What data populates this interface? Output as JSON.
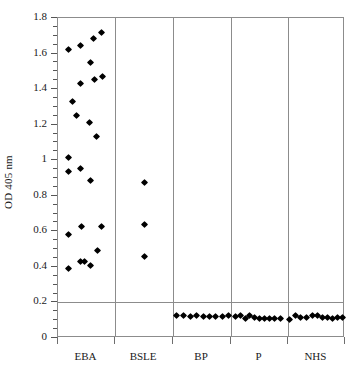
{
  "chart_data": {
    "type": "scatter",
    "title": "",
    "xlabel": "",
    "ylabel": "OD 405 nm",
    "ylim": [
      0,
      1.8
    ],
    "yticks": [
      0,
      0.2,
      0.4,
      0.6,
      0.8,
      1.0,
      1.2,
      1.4,
      1.6,
      1.8
    ],
    "ytick_labels": [
      "0",
      "0.2",
      "0.4",
      "0.6",
      "0.8",
      "1",
      "1.2",
      "1.4",
      "1.6",
      "1.8"
    ],
    "yminor_step": 0.05,
    "grid": "horizontal gridline at 0.2 only",
    "gridlines": [
      0.2
    ],
    "legend": "none",
    "categories": [
      "EBA",
      "BSLE",
      "BP",
      "P",
      "NHS"
    ],
    "group_separators_x_frac": [
      0.199,
      0.401,
      0.603,
      0.801
    ],
    "marker": "filled diamond",
    "marker_color": "#000000",
    "axis_color": "#8c8c8c",
    "series": [
      {
        "name": "EBA",
        "n": 19,
        "points": [
          {
            "x": 0.035,
            "y": 1.622
          },
          {
            "x": 0.05,
            "y": 1.33
          },
          {
            "x": 0.064,
            "y": 1.253
          },
          {
            "x": 0.038,
            "y": 1.013
          },
          {
            "x": 0.037,
            "y": 0.936
          },
          {
            "x": 0.036,
            "y": 0.58
          },
          {
            "x": 0.035,
            "y": 0.393
          },
          {
            "x": 0.078,
            "y": 1.645
          },
          {
            "x": 0.077,
            "y": 1.43
          },
          {
            "x": 0.08,
            "y": 0.952
          },
          {
            "x": 0.081,
            "y": 0.625
          },
          {
            "x": 0.079,
            "y": 0.43
          },
          {
            "x": 0.092,
            "y": 0.428
          },
          {
            "x": 0.112,
            "y": 1.552
          },
          {
            "x": 0.11,
            "y": 1.213
          },
          {
            "x": 0.113,
            "y": 0.885
          },
          {
            "x": 0.114,
            "y": 0.408
          },
          {
            "x": 0.122,
            "y": 1.683
          },
          {
            "x": 0.128,
            "y": 1.452
          },
          {
            "x": 0.133,
            "y": 1.133
          },
          {
            "x": 0.136,
            "y": 0.49
          },
          {
            "x": 0.15,
            "y": 1.718
          },
          {
            "x": 0.154,
            "y": 1.473
          },
          {
            "x": 0.152,
            "y": 0.628
          }
        ]
      },
      {
        "name": "BSLE",
        "n": 3,
        "points": [
          {
            "x": 0.3,
            "y": 0.872
          },
          {
            "x": 0.3,
            "y": 0.637
          },
          {
            "x": 0.3,
            "y": 0.46
          }
        ]
      },
      {
        "name": "BP",
        "n": 9,
        "points": [
          {
            "x": 0.413,
            "y": 0.124
          },
          {
            "x": 0.438,
            "y": 0.125
          },
          {
            "x": 0.461,
            "y": 0.122
          },
          {
            "x": 0.483,
            "y": 0.126
          },
          {
            "x": 0.506,
            "y": 0.123
          },
          {
            "x": 0.528,
            "y": 0.121
          },
          {
            "x": 0.55,
            "y": 0.12
          },
          {
            "x": 0.572,
            "y": 0.12
          },
          {
            "x": 0.594,
            "y": 0.128
          }
        ]
      },
      {
        "name": "P",
        "n": 10,
        "points": [
          {
            "x": 0.618,
            "y": 0.123
          },
          {
            "x": 0.637,
            "y": 0.126
          },
          {
            "x": 0.652,
            "y": 0.112
          },
          {
            "x": 0.667,
            "y": 0.124
          },
          {
            "x": 0.685,
            "y": 0.114
          },
          {
            "x": 0.703,
            "y": 0.112
          },
          {
            "x": 0.72,
            "y": 0.109
          },
          {
            "x": 0.738,
            "y": 0.108
          },
          {
            "x": 0.756,
            "y": 0.107
          },
          {
            "x": 0.776,
            "y": 0.11
          }
        ]
      },
      {
        "name": "NHS",
        "n": 11,
        "points": [
          {
            "x": 0.806,
            "y": 0.106
          },
          {
            "x": 0.826,
            "y": 0.124
          },
          {
            "x": 0.846,
            "y": 0.116
          },
          {
            "x": 0.866,
            "y": 0.114
          },
          {
            "x": 0.886,
            "y": 0.128
          },
          {
            "x": 0.905,
            "y": 0.124
          },
          {
            "x": 0.922,
            "y": 0.118
          },
          {
            "x": 0.94,
            "y": 0.113
          },
          {
            "x": 0.958,
            "y": 0.112
          },
          {
            "x": 0.974,
            "y": 0.114
          },
          {
            "x": 0.99,
            "y": 0.113
          }
        ]
      }
    ]
  }
}
